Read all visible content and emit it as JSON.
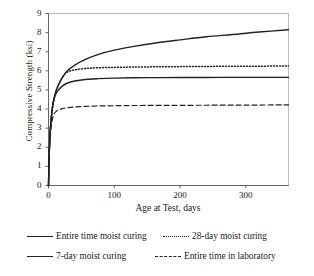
{
  "chart_data": {
    "type": "line",
    "title": "",
    "xlabel": "Age at Test, days",
    "ylabel": "Compressive Strength (ksi)",
    "xlim": [
      0,
      365
    ],
    "ylim": [
      0,
      9
    ],
    "xticks": [
      0,
      100,
      200,
      300
    ],
    "yticks": [
      0,
      1,
      2,
      3,
      4,
      5,
      6,
      7,
      8,
      9
    ],
    "grid": false,
    "legend_position": "below",
    "line_color": "#222222",
    "frame_color": "#bbbbbb",
    "series": [
      {
        "name": "Entire time moist curing",
        "style": "solid",
        "x": [
          0,
          1,
          2,
          3,
          5,
          7,
          10,
          14,
          21,
          28,
          40,
          56,
          75,
          100,
          130,
          165,
          200,
          240,
          280,
          320,
          365
        ],
        "y": [
          0.0,
          1.55,
          2.45,
          3.05,
          3.8,
          4.3,
          4.78,
          5.18,
          5.65,
          5.98,
          6.3,
          6.6,
          6.85,
          7.08,
          7.28,
          7.47,
          7.62,
          7.78,
          7.9,
          8.03,
          8.15
        ]
      },
      {
        "name": "28-day moist curing",
        "style": "dotted",
        "x": [
          0,
          1,
          2,
          3,
          5,
          7,
          10,
          14,
          21,
          28,
          40,
          56,
          75,
          100,
          130,
          165,
          200,
          240,
          280,
          320,
          365
        ],
        "y": [
          0.0,
          1.55,
          2.45,
          3.05,
          3.8,
          4.3,
          4.78,
          5.18,
          5.65,
          5.92,
          6.05,
          6.12,
          6.16,
          6.18,
          6.2,
          6.21,
          6.22,
          6.23,
          6.24,
          6.245,
          6.25
        ]
      },
      {
        "name": "7-day moist curing",
        "style": "solid",
        "x": [
          0,
          1,
          2,
          3,
          5,
          7,
          10,
          14,
          21,
          28,
          40,
          56,
          75,
          100,
          130,
          165,
          200,
          240,
          280,
          320,
          365
        ],
        "y": [
          0.0,
          1.55,
          2.45,
          3.05,
          3.8,
          4.3,
          4.7,
          4.95,
          5.2,
          5.35,
          5.47,
          5.55,
          5.59,
          5.62,
          5.635,
          5.645,
          5.65,
          5.655,
          5.66,
          5.66,
          5.66
        ]
      },
      {
        "name": "Entire time in laboratory",
        "style": "dashed",
        "x": [
          0,
          1,
          2,
          3,
          5,
          7,
          10,
          14,
          21,
          28,
          40,
          56,
          75,
          100,
          130,
          165,
          200,
          240,
          280,
          320,
          365
        ],
        "y": [
          0.0,
          1.45,
          2.25,
          2.75,
          3.3,
          3.62,
          3.82,
          3.93,
          4.02,
          4.07,
          4.11,
          4.14,
          4.16,
          4.175,
          4.185,
          4.19,
          4.195,
          4.2,
          4.205,
          4.21,
          4.22
        ]
      }
    ]
  },
  "axes": {
    "y_title": "Compressive Strength (ksi)",
    "x_title": "Age at Test, days",
    "y_tick_labels": [
      "9",
      "8",
      "7",
      "6",
      "5",
      "4",
      "3",
      "2",
      "1",
      "0"
    ],
    "x_tick_labels": [
      "0",
      "100",
      "200",
      "300"
    ]
  },
  "legend": {
    "rows": [
      [
        {
          "label": "Entire time moist curing",
          "style": "solid"
        },
        {
          "label": "28-day moist curing",
          "style": "dotted"
        }
      ],
      [
        {
          "label": "7-day moist curing",
          "style": "solid"
        },
        {
          "label": "Entire time in laboratory",
          "style": "dashed"
        }
      ]
    ]
  }
}
